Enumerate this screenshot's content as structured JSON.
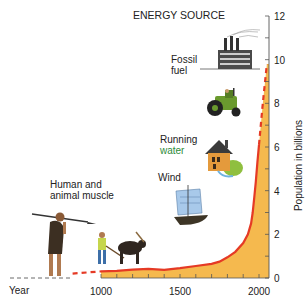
{
  "chart_data": {
    "type": "area",
    "title": "ENERGY SOURCE",
    "xlabel": "Year",
    "ylabel": "Population in billions",
    "xlim": [
      400,
      2060
    ],
    "ylim": [
      0,
      12
    ],
    "x_ticks": [
      1000,
      1500,
      2000
    ],
    "y_ticks": [
      0,
      2,
      4,
      6,
      8,
      10,
      12
    ],
    "series": [
      {
        "name": "World population (historical)",
        "style": "solid",
        "x": [
          1000,
          1100,
          1200,
          1300,
          1400,
          1500,
          1600,
          1700,
          1750,
          1800,
          1850,
          1900,
          1930,
          1950,
          1960,
          1970,
          1980,
          1990,
          2000
        ],
        "values": [
          0.3,
          0.33,
          0.38,
          0.42,
          0.37,
          0.45,
          0.55,
          0.65,
          0.75,
          0.95,
          1.2,
          1.6,
          2.0,
          2.5,
          3.0,
          3.7,
          4.4,
          5.3,
          6.1
        ]
      },
      {
        "name": "Population (projected)",
        "style": "dashed",
        "x": [
          2000,
          2010,
          2020,
          2030,
          2040,
          2050
        ],
        "values": [
          6.1,
          6.9,
          7.7,
          8.4,
          9.1,
          9.8
        ]
      },
      {
        "name": "Population (earlier estimate)",
        "style": "dashed",
        "x": [
          820,
          1000
        ],
        "values": [
          0.2,
          0.3
        ]
      }
    ],
    "annotations": [
      {
        "label": "Human and animal muscle"
      },
      {
        "label": "Wind"
      },
      {
        "label": "Running water"
      },
      {
        "label": "Fossil fuel"
      }
    ],
    "colors": {
      "fill": "#f5b94e",
      "line": "#e53a25",
      "axis": "#555555",
      "text": "#222222"
    }
  },
  "labels": {
    "title": "ENERGY SOURCE",
    "muscle": "Human and\nanimal muscle",
    "wind": "Wind",
    "water_1": "Running",
    "water_2": "water",
    "fossil_1": "Fossil",
    "fossil_2": "fuel",
    "year": "Year",
    "ylabel": "Population in billions"
  }
}
